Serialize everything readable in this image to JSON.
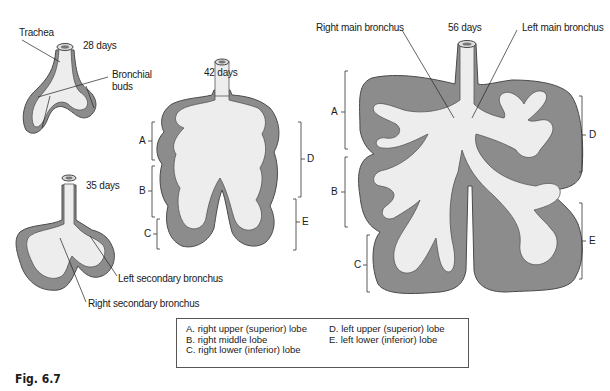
{
  "stages": {
    "d28": {
      "age": "28 days",
      "labels": {
        "trachea": "Trachea",
        "buds": "Bronchial\nbuds",
        "buds_line1": "Bronchial",
        "buds_line2": "buds"
      }
    },
    "d35": {
      "age": "35 days",
      "labels": {
        "left_secondary": "Left secondary bronchus",
        "right_secondary": "Right secondary bronchus"
      }
    },
    "d42": {
      "age": "42 days",
      "brackets": [
        "A",
        "B",
        "C",
        "D",
        "E"
      ]
    },
    "d56": {
      "age": "56 days",
      "labels": {
        "right_main": "Right main bronchus",
        "left_main": "Left main bronchus"
      },
      "brackets": [
        "A",
        "B",
        "C",
        "D",
        "E"
      ]
    }
  },
  "legend": {
    "items": [
      {
        "key": "A.",
        "text": "right upper (superior) lobe"
      },
      {
        "key": "B.",
        "text": "right middle lobe"
      },
      {
        "key": "C.",
        "text": "right lower (inferior) lobe"
      },
      {
        "key": "D.",
        "text": "left upper (superior) lobe"
      },
      {
        "key": "E.",
        "text": "left lower (inferior) lobe"
      }
    ]
  },
  "figure_label": "Fig. 6.7",
  "colors": {
    "tissue": "#8a8a8a",
    "tissue_edge": "#5a5a5a",
    "airway": "#ececec",
    "ink": "#1a1a1a"
  }
}
